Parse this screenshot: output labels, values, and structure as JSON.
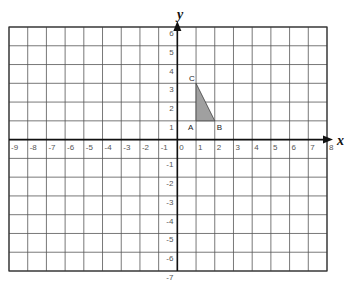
{
  "grid": {
    "x_min": -9,
    "x_max": 8,
    "y_min": -7,
    "y_max": 6,
    "left_px": 9,
    "right_px": 327,
    "top_px": 27,
    "bottom_px": 271,
    "line_color": "#555555",
    "axis_color": "#111111"
  },
  "axes": {
    "x_label": "x",
    "y_label": "y",
    "x_ticks": [
      "-9",
      "-8",
      "-7",
      "-6",
      "-5",
      "-4",
      "-3",
      "-2",
      "-1",
      "0",
      "1",
      "2",
      "3",
      "4",
      "5",
      "6",
      "7",
      "8"
    ],
    "y_ticks": [
      "6",
      "5",
      "4",
      "3",
      "2",
      "1",
      "-1",
      "-2",
      "-3",
      "-4",
      "-5",
      "-6",
      "-7"
    ]
  },
  "triangle": {
    "fill": "#a0a0a0",
    "vertices": [
      {
        "label": "A",
        "x": 1,
        "y": 1
      },
      {
        "label": "B",
        "x": 2,
        "y": 1
      },
      {
        "label": "C",
        "x": 1,
        "y": 3
      }
    ]
  }
}
